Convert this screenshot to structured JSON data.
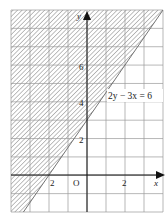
{
  "chart_data": {
    "type": "area",
    "title": "",
    "xlabel": "x",
    "ylabel": "y",
    "xlim": [
      -4,
      4
    ],
    "ylim": [
      -2,
      9
    ],
    "grid": true,
    "grid_step": 1,
    "x_tick_labels": [
      {
        "value": -2,
        "label": "2"
      },
      {
        "value": 2,
        "label": "2"
      }
    ],
    "y_tick_labels": [
      {
        "value": 2,
        "label": "2"
      },
      {
        "value": 4,
        "label": "4"
      },
      {
        "value": 6,
        "label": "6"
      }
    ],
    "origin_label": "O",
    "series": [
      {
        "name": "2y − 3x = 6",
        "kind": "boundary-line",
        "equation": "y = 1.5x + 3",
        "points": [
          [
            -4.0,
            -3.0
          ],
          [
            -2,
            0
          ],
          [
            0,
            3
          ],
          [
            4,
            9
          ]
        ]
      }
    ],
    "shaded_region": {
      "description": "hatched region above/left of the line",
      "inequality": "2y - 3x >= 6",
      "style": "diagonal hatching"
    },
    "annotations": [
      {
        "text": "2y − 3x = 6",
        "x": 0.4,
        "y": 4.5
      }
    ]
  },
  "labels": {
    "x_axis": "x",
    "y_axis": "y",
    "origin": "O",
    "equation": "2y − 3x = 6",
    "tick_x_neg2": "2",
    "tick_x_2": "2",
    "tick_y_2": "2",
    "tick_y_4": "4",
    "tick_y_6": "6"
  },
  "colors": {
    "grid": "#9a9a9a",
    "axis": "#111111",
    "hatch": "#8c8c8c",
    "boundary": "#555555"
  }
}
